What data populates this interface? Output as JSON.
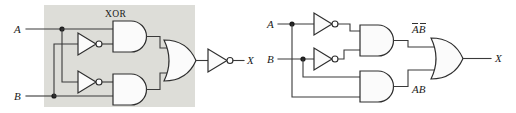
{
  "figure": {
    "type": "logic-circuit-diagram",
    "background_color": "#ffffff",
    "wire_color": "#3a3a3a",
    "gate_fill": "#fbfbfb",
    "panel_color": "#ddddd8"
  },
  "left_circuit": {
    "name": "xnor-via-xor-block",
    "panel_label": "XOR",
    "inputs": [
      {
        "id": "A",
        "label": "A"
      },
      {
        "id": "B",
        "label": "B"
      }
    ],
    "outputs": [
      {
        "id": "X",
        "label": "X"
      }
    ],
    "gates": [
      {
        "id": "inv-a",
        "type": "inverter",
        "label": "NOT"
      },
      {
        "id": "inv-b",
        "type": "inverter",
        "label": "NOT"
      },
      {
        "id": "and-top",
        "type": "and",
        "label": "AND"
      },
      {
        "id": "and-bottom",
        "type": "and",
        "label": "AND"
      },
      {
        "id": "or-out",
        "type": "or",
        "label": "OR"
      },
      {
        "id": "inv-out",
        "type": "inverter",
        "label": "NOT"
      }
    ]
  },
  "right_circuit": {
    "name": "xnor-sum-of-products",
    "inputs": [
      {
        "id": "A",
        "label": "A"
      },
      {
        "id": "B",
        "label": "B"
      }
    ],
    "outputs": [
      {
        "id": "X",
        "label": "X"
      }
    ],
    "intermediate_labels": [
      {
        "id": "not-a-not-b",
        "text": "AB",
        "overbar": "both",
        "display": "A̅B̅"
      },
      {
        "id": "a-and-b",
        "text": "AB",
        "overbar": "none",
        "display": "AB"
      }
    ],
    "gates": [
      {
        "id": "inv-a",
        "type": "inverter",
        "label": "NOT"
      },
      {
        "id": "inv-b",
        "type": "inverter",
        "label": "NOT"
      },
      {
        "id": "and-top",
        "type": "and",
        "label": "AND"
      },
      {
        "id": "and-bottom",
        "type": "and",
        "label": "AND"
      },
      {
        "id": "or-out",
        "type": "or",
        "label": "OR"
      }
    ]
  }
}
